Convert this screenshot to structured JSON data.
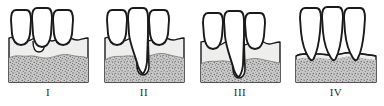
{
  "figure": {
    "panel_count": 4,
    "colors": {
      "outline": "#1a1a1a",
      "tooth_fill": "#ffffff",
      "gingiva_fill": "#eeeeec",
      "bone_fill": "#c9c9c9",
      "bone_speckle": "#6e6e6e",
      "label_text": "#2b2b2b",
      "background": "#ffffff"
    }
  },
  "panels": [
    {
      "label": "I",
      "name": "stage-one",
      "tooth_count": 3,
      "defect": "shallow-crater-between-left-and-center",
      "bone_level": "near-normal",
      "bone_top_y": 58,
      "description": "Normal to slight bone level with shallow interdental crater"
    },
    {
      "label": "II",
      "name": "stage-two",
      "tooth_count": 3,
      "defect": "deep-narrow-vertical-between-center-and-right",
      "bone_level": "moderate-loss",
      "bone_top_y": 58,
      "description": "Deep narrow vertical intrabony defect along one root"
    },
    {
      "label": "III",
      "name": "stage-three",
      "tooth_count": 3,
      "defect": "deep-vertical-with-horizontal-recession",
      "bone_level": "advanced-loss",
      "bone_top_y": 62,
      "description": "Advanced bone loss with deep vertical defect and recession"
    },
    {
      "label": "IV",
      "name": "stage-four",
      "tooth_count": 3,
      "defect": "horizontal-severe",
      "bone_level": "severe-horizontal-loss",
      "bone_top_y": 62,
      "description": "Severe horizontal bone loss with long exposed roots"
    }
  ]
}
